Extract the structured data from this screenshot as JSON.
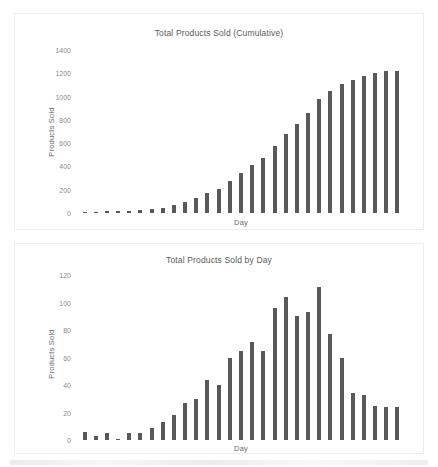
{
  "chart_data": [
    {
      "type": "bar",
      "id": "cumulative",
      "title": "Total Products Sold (Cumulative)",
      "xlabel": "Day",
      "ylabel": "Products Sold",
      "ylim": [
        0,
        1400
      ],
      "yticks": [
        1400,
        1200,
        1000,
        800,
        600,
        400,
        200,
        0
      ],
      "grid": false,
      "legend": "none",
      "bar_color": "#595959",
      "categories": [
        "1",
        "2",
        "3",
        "4",
        "5",
        "6",
        "7",
        "8",
        "9",
        "10",
        "11",
        "12",
        "13",
        "14",
        "15",
        "16",
        "17",
        "18",
        "19",
        "20",
        "21",
        "22",
        "23",
        "24",
        "25",
        "26",
        "27",
        "28",
        "29"
      ],
      "values": [
        6,
        9,
        14,
        15,
        20,
        25,
        34,
        47,
        65,
        95,
        125,
        169,
        209,
        276,
        341,
        411,
        476,
        576,
        676,
        767,
        860,
        976,
        1046,
        1106,
        1140,
        1174,
        1199,
        1221,
        1224
      ]
    },
    {
      "type": "bar",
      "id": "daily",
      "title": "Total Products Sold by Day",
      "xlabel": "Day",
      "ylabel": "Products Sold",
      "ylim": [
        0,
        120
      ],
      "yticks": [
        120,
        100,
        80,
        60,
        40,
        20,
        0
      ],
      "grid": false,
      "legend": "none",
      "bar_color": "#595959",
      "categories": [
        "1",
        "2",
        "3",
        "4",
        "5",
        "6",
        "7",
        "8",
        "9",
        "10",
        "11",
        "12",
        "13",
        "14",
        "15",
        "16",
        "17",
        "18",
        "19",
        "20",
        "21",
        "22",
        "23",
        "24",
        "25",
        "26",
        "27",
        "28",
        "29"
      ],
      "values": [
        6,
        3,
        5,
        1,
        5,
        5,
        9,
        13,
        18,
        27,
        30,
        44,
        40,
        60,
        65,
        71,
        65,
        96,
        104,
        90,
        93,
        111,
        77,
        60,
        34,
        33,
        25,
        24,
        24
      ]
    }
  ]
}
